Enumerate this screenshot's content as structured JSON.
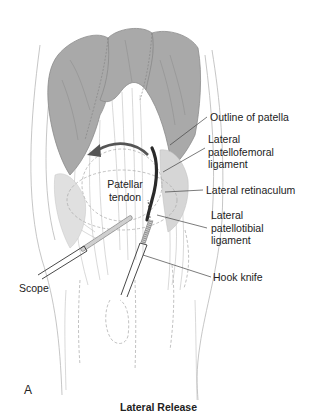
{
  "figure": {
    "panel_letter": "A",
    "caption": "Lateral Release",
    "labels": {
      "outline_of_patella": "Outline of patella",
      "lateral_patellofemoral_ligament": [
        "Lateral",
        "patellofemoral",
        "ligament"
      ],
      "lateral_retinaculum": "Lateral retinaculum",
      "lateral_patellotibial_ligament": [
        "Lateral",
        "patellotibial",
        "ligament"
      ],
      "hook_knife": "Hook knife",
      "scope": "Scope",
      "patellar_tendon": [
        "Patellar",
        "tendon"
      ]
    },
    "colors": {
      "muscle_fill": "#a8a8a8",
      "muscle_stroke": "#8a8a8a",
      "line": "#555555",
      "light_line": "#b5b5b5",
      "dashed": "#b0b0b0",
      "cut_line": "#2a2a2a",
      "arrow": "#555555",
      "instrument_shaft": "#ffffff",
      "instrument_tip": "#cccccc"
    }
  }
}
